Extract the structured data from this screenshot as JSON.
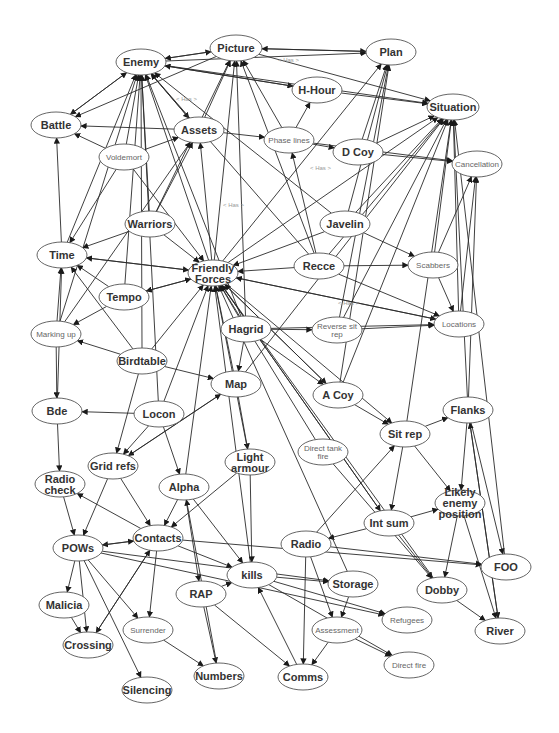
{
  "diagram": {
    "type": "concept-network",
    "nodes": [
      {
        "id": "enemy",
        "label": "Enemy",
        "x": 141,
        "y": 62,
        "rx": 25,
        "ry": 13,
        "style": "bold"
      },
      {
        "id": "picture",
        "label": "Picture",
        "x": 236,
        "y": 48,
        "rx": 26,
        "ry": 13,
        "style": "bold"
      },
      {
        "id": "plan",
        "label": "Plan",
        "x": 391,
        "y": 52,
        "rx": 25,
        "ry": 13,
        "style": "bold"
      },
      {
        "id": "hhour",
        "label": "H-Hour",
        "x": 317,
        "y": 90,
        "rx": 25,
        "ry": 13,
        "style": "bold"
      },
      {
        "id": "situation",
        "label": "Situation",
        "x": 453,
        "y": 107,
        "rx": 26,
        "ry": 13,
        "style": "bold"
      },
      {
        "id": "battle",
        "label": "Battle",
        "x": 56,
        "y": 125,
        "rx": 25,
        "ry": 13,
        "style": "bold"
      },
      {
        "id": "assets",
        "label": "Assets",
        "x": 199,
        "y": 130,
        "rx": 25,
        "ry": 13,
        "style": "bold"
      },
      {
        "id": "phaselines",
        "label": "Phase lines",
        "x": 289,
        "y": 140,
        "rx": 25,
        "ry": 13,
        "style": "light"
      },
      {
        "id": "dcoy",
        "label": "D Coy",
        "x": 358,
        "y": 152,
        "rx": 25,
        "ry": 13,
        "style": "bold"
      },
      {
        "id": "voldemort",
        "label": "Voldemort",
        "x": 124,
        "y": 157,
        "rx": 25,
        "ry": 13,
        "style": "light"
      },
      {
        "id": "cancellation",
        "label": "Cancellation",
        "x": 477,
        "y": 164,
        "rx": 25,
        "ry": 13,
        "style": "light"
      },
      {
        "id": "warriors",
        "label": "Warriors",
        "x": 150,
        "y": 224,
        "rx": 25,
        "ry": 13,
        "style": "bold"
      },
      {
        "id": "javelin",
        "label": "Javelin",
        "x": 345,
        "y": 224,
        "rx": 25,
        "ry": 13,
        "style": "bold"
      },
      {
        "id": "time",
        "label": "Time",
        "x": 62,
        "y": 255,
        "rx": 25,
        "ry": 13,
        "style": "bold"
      },
      {
        "id": "friendly",
        "label": "Friendly Forces",
        "x": 213,
        "y": 273,
        "rx": 25,
        "ry": 13,
        "style": "bold"
      },
      {
        "id": "recce",
        "label": "Recce",
        "x": 319,
        "y": 266,
        "rx": 25,
        "ry": 13,
        "style": "bold"
      },
      {
        "id": "scabbers",
        "label": "Scabbers",
        "x": 433,
        "y": 265,
        "rx": 25,
        "ry": 13,
        "style": "light"
      },
      {
        "id": "tempo",
        "label": "Tempo",
        "x": 124,
        "y": 297,
        "rx": 25,
        "ry": 13,
        "style": "bold"
      },
      {
        "id": "markingup",
        "label": "Marking up",
        "x": 56,
        "y": 334,
        "rx": 25,
        "ry": 13,
        "style": "light"
      },
      {
        "id": "hagrid",
        "label": "Hagrid",
        "x": 246,
        "y": 329,
        "rx": 25,
        "ry": 13,
        "style": "bold"
      },
      {
        "id": "reversesitrep",
        "label": "Reverse sit rep",
        "x": 337,
        "y": 330,
        "rx": 25,
        "ry": 13,
        "style": "light"
      },
      {
        "id": "locations",
        "label": "Locations",
        "x": 459,
        "y": 324,
        "rx": 25,
        "ry": 13,
        "style": "light"
      },
      {
        "id": "birdtable",
        "label": "Birdtable",
        "x": 142,
        "y": 361,
        "rx": 25,
        "ry": 13,
        "style": "bold"
      },
      {
        "id": "map",
        "label": "Map",
        "x": 236,
        "y": 384,
        "rx": 25,
        "ry": 13,
        "style": "bold"
      },
      {
        "id": "acoy",
        "label": "A Coy",
        "x": 338,
        "y": 395,
        "rx": 25,
        "ry": 13,
        "style": "bold"
      },
      {
        "id": "flanks",
        "label": "Flanks",
        "x": 468,
        "y": 410,
        "rx": 25,
        "ry": 13,
        "style": "bold"
      },
      {
        "id": "bde",
        "label": "Bde",
        "x": 57,
        "y": 411,
        "rx": 25,
        "ry": 13,
        "style": "bold"
      },
      {
        "id": "locon",
        "label": "Locon",
        "x": 159,
        "y": 414,
        "rx": 25,
        "ry": 13,
        "style": "bold"
      },
      {
        "id": "sitrep",
        "label": "Sit rep",
        "x": 405,
        "y": 434,
        "rx": 25,
        "ry": 13,
        "style": "bold"
      },
      {
        "id": "directtankfire",
        "label": "Direct tank fire",
        "x": 323,
        "y": 452,
        "rx": 25,
        "ry": 13,
        "style": "light"
      },
      {
        "id": "lightarmour",
        "label": "Light armour",
        "x": 250,
        "y": 462,
        "rx": 25,
        "ry": 13,
        "style": "bold"
      },
      {
        "id": "gridrefs",
        "label": "Grid refs",
        "x": 113,
        "y": 466,
        "rx": 25,
        "ry": 13,
        "style": "bold"
      },
      {
        "id": "radiocheck",
        "label": "Radio check",
        "x": 60,
        "y": 484,
        "rx": 25,
        "ry": 13,
        "style": "bold"
      },
      {
        "id": "alpha",
        "label": "Alpha",
        "x": 184,
        "y": 487,
        "rx": 25,
        "ry": 13,
        "style": "bold"
      },
      {
        "id": "likelyenemy",
        "label": "Likely enemy position",
        "x": 460,
        "y": 503,
        "rx": 25,
        "ry": 13,
        "style": "bold"
      },
      {
        "id": "intsum",
        "label": "Int sum",
        "x": 389,
        "y": 523,
        "rx": 25,
        "ry": 13,
        "style": "bold"
      },
      {
        "id": "contacts",
        "label": "Contacts",
        "x": 158,
        "y": 538,
        "rx": 25,
        "ry": 13,
        "style": "bold"
      },
      {
        "id": "radio",
        "label": "Radio",
        "x": 306,
        "y": 544,
        "rx": 25,
        "ry": 13,
        "style": "bold"
      },
      {
        "id": "pows",
        "label": "POWs",
        "x": 78,
        "y": 548,
        "rx": 25,
        "ry": 13,
        "style": "bold"
      },
      {
        "id": "foo",
        "label": "FOO",
        "x": 506,
        "y": 567,
        "rx": 25,
        "ry": 13,
        "style": "bold"
      },
      {
        "id": "kills",
        "label": "kills",
        "x": 252,
        "y": 575,
        "rx": 25,
        "ry": 13,
        "style": "bold"
      },
      {
        "id": "dobby",
        "label": "Dobby",
        "x": 442,
        "y": 590,
        "rx": 25,
        "ry": 13,
        "style": "bold"
      },
      {
        "id": "storage",
        "label": "Storage",
        "x": 353,
        "y": 584,
        "rx": 25,
        "ry": 13,
        "style": "bold"
      },
      {
        "id": "rap",
        "label": "RAP",
        "x": 201,
        "y": 594,
        "rx": 25,
        "ry": 13,
        "style": "bold"
      },
      {
        "id": "malicia",
        "label": "Malicia",
        "x": 64,
        "y": 605,
        "rx": 25,
        "ry": 13,
        "style": "bold"
      },
      {
        "id": "refugees",
        "label": "Refugees",
        "x": 407,
        "y": 620,
        "rx": 25,
        "ry": 13,
        "style": "light"
      },
      {
        "id": "river",
        "label": "River",
        "x": 500,
        "y": 631,
        "rx": 25,
        "ry": 13,
        "style": "bold"
      },
      {
        "id": "assessment",
        "label": "Assessment",
        "x": 337,
        "y": 630,
        "rx": 25,
        "ry": 13,
        "style": "light"
      },
      {
        "id": "surrender",
        "label": "Surrender",
        "x": 148,
        "y": 630,
        "rx": 25,
        "ry": 13,
        "style": "light"
      },
      {
        "id": "crossing",
        "label": "Crossing",
        "x": 88,
        "y": 645,
        "rx": 25,
        "ry": 13,
        "style": "bold"
      },
      {
        "id": "directfire",
        "label": "Direct fire",
        "x": 409,
        "y": 665,
        "rx": 25,
        "ry": 13,
        "style": "light"
      },
      {
        "id": "numbers",
        "label": "Numbers",
        "x": 219,
        "y": 676,
        "rx": 25,
        "ry": 13,
        "style": "bold"
      },
      {
        "id": "comms",
        "label": "Comms",
        "x": 303,
        "y": 677,
        "rx": 25,
        "ry": 13,
        "style": "bold"
      },
      {
        "id": "silencing",
        "label": "Silencing",
        "x": 147,
        "y": 690,
        "rx": 25,
        "ry": 13,
        "style": "bold"
      }
    ],
    "edge_labels": [
      {
        "text": "< Has >",
        "x": 176,
        "y": 101
      },
      {
        "text": "< Has >",
        "x": 278,
        "y": 62
      },
      {
        "text": "< Has >",
        "x": 310,
        "y": 170
      },
      {
        "text": "< Has >",
        "x": 223,
        "y": 207
      },
      {
        "text": "< Has >",
        "x": 338,
        "y": 305
      }
    ],
    "edges": [
      [
        "enemy",
        "picture"
      ],
      [
        "picture",
        "enemy"
      ],
      [
        "enemy",
        "battle"
      ],
      [
        "battle",
        "enemy"
      ],
      [
        "enemy",
        "assets"
      ],
      [
        "enemy",
        "plan"
      ],
      [
        "enemy",
        "hhour"
      ],
      [
        "enemy",
        "situation"
      ],
      [
        "picture",
        "plan"
      ],
      [
        "picture",
        "situation"
      ],
      [
        "picture",
        "battle"
      ],
      [
        "plan",
        "picture"
      ],
      [
        "hhour",
        "situation"
      ],
      [
        "hhour",
        "enemy"
      ],
      [
        "assets",
        "battle"
      ],
      [
        "assets",
        "phaselines"
      ],
      [
        "assets",
        "picture"
      ],
      [
        "assets",
        "enemy"
      ],
      [
        "phaselines",
        "dcoy"
      ],
      [
        "phaselines",
        "cancellation"
      ],
      [
        "phaselines",
        "hhour"
      ],
      [
        "phaselines",
        "picture"
      ],
      [
        "dcoy",
        "situation"
      ],
      [
        "dcoy",
        "cancellation"
      ],
      [
        "dcoy",
        "plan"
      ],
      [
        "voldemort",
        "battle"
      ],
      [
        "voldemort",
        "assets"
      ],
      [
        "voldemort",
        "enemy"
      ],
      [
        "voldemort",
        "time"
      ],
      [
        "voldemort",
        "friendly"
      ],
      [
        "warriors",
        "enemy"
      ],
      [
        "warriors",
        "time"
      ],
      [
        "warriors",
        "friendly"
      ],
      [
        "warriors",
        "picture"
      ],
      [
        "warriors",
        "assets"
      ],
      [
        "javelin",
        "enemy"
      ],
      [
        "javelin",
        "situation"
      ],
      [
        "javelin",
        "plan"
      ],
      [
        "javelin",
        "scabbers"
      ],
      [
        "javelin",
        "friendly"
      ],
      [
        "time",
        "battle"
      ],
      [
        "time",
        "friendly"
      ],
      [
        "time",
        "enemy"
      ],
      [
        "friendly",
        "time"
      ],
      [
        "friendly",
        "tempo"
      ],
      [
        "friendly",
        "enemy"
      ],
      [
        "friendly",
        "picture"
      ],
      [
        "friendly",
        "plan"
      ],
      [
        "friendly",
        "situation"
      ],
      [
        "friendly",
        "assets"
      ],
      [
        "friendly",
        "acoy"
      ],
      [
        "friendly",
        "sitrep"
      ],
      [
        "friendly",
        "intsum"
      ],
      [
        "friendly",
        "locations"
      ],
      [
        "recce",
        "friendly"
      ],
      [
        "recce",
        "situation"
      ],
      [
        "recce",
        "picture"
      ],
      [
        "recce",
        "locations"
      ],
      [
        "recce",
        "phaselines"
      ],
      [
        "recce",
        "enemy"
      ],
      [
        "recce",
        "scabbers"
      ],
      [
        "scabbers",
        "situation"
      ],
      [
        "scabbers",
        "cancellation"
      ],
      [
        "scabbers",
        "locations"
      ],
      [
        "tempo",
        "time"
      ],
      [
        "tempo",
        "friendly"
      ],
      [
        "tempo",
        "enemy"
      ],
      [
        "tempo",
        "markingup"
      ],
      [
        "markingup",
        "time"
      ],
      [
        "markingup",
        "enemy"
      ],
      [
        "markingup",
        "assets"
      ],
      [
        "markingup",
        "bde"
      ],
      [
        "hagrid",
        "friendly"
      ],
      [
        "hagrid",
        "map"
      ],
      [
        "hagrid",
        "reversesitrep"
      ],
      [
        "hagrid",
        "locations"
      ],
      [
        "hagrid",
        "picture"
      ],
      [
        "hagrid",
        "enemy"
      ],
      [
        "hagrid",
        "acoy"
      ],
      [
        "reversesitrep",
        "situation"
      ],
      [
        "reversesitrep",
        "plan"
      ],
      [
        "reversesitrep",
        "locations"
      ],
      [
        "locations",
        "situation"
      ],
      [
        "locations",
        "friendly"
      ],
      [
        "locations",
        "cancellation"
      ],
      [
        "birdtable",
        "markingup"
      ],
      [
        "birdtable",
        "friendly"
      ],
      [
        "birdtable",
        "map"
      ],
      [
        "birdtable",
        "time"
      ],
      [
        "birdtable",
        "enemy"
      ],
      [
        "birdtable",
        "gridrefs"
      ],
      [
        "map",
        "friendly"
      ],
      [
        "map",
        "lightarmour"
      ],
      [
        "map",
        "gridrefs"
      ],
      [
        "map",
        "situation"
      ],
      [
        "acoy",
        "friendly"
      ],
      [
        "acoy",
        "sitrep"
      ],
      [
        "acoy",
        "situation"
      ],
      [
        "acoy",
        "plan"
      ],
      [
        "flanks",
        "situation"
      ],
      [
        "flanks",
        "cancellation"
      ],
      [
        "flanks",
        "likelyenemy"
      ],
      [
        "flanks",
        "river"
      ],
      [
        "flanks",
        "foo"
      ],
      [
        "bde",
        "time"
      ],
      [
        "bde",
        "radiocheck"
      ],
      [
        "locon",
        "bde"
      ],
      [
        "locon",
        "gridrefs"
      ],
      [
        "locon",
        "alpha"
      ],
      [
        "locon",
        "friendly"
      ],
      [
        "locon",
        "enemy"
      ],
      [
        "sitrep",
        "situation"
      ],
      [
        "sitrep",
        "likelyenemy"
      ],
      [
        "sitrep",
        "intsum"
      ],
      [
        "sitrep",
        "flanks"
      ],
      [
        "directtankfire",
        "friendly"
      ],
      [
        "directtankfire",
        "dobby"
      ],
      [
        "lightarmour",
        "friendly"
      ],
      [
        "lightarmour",
        "contacts"
      ],
      [
        "lightarmour",
        "kills"
      ],
      [
        "gridrefs",
        "contacts"
      ],
      [
        "gridrefs",
        "pows"
      ],
      [
        "gridrefs",
        "map"
      ],
      [
        "radiocheck",
        "pows"
      ],
      [
        "alpha",
        "contacts"
      ],
      [
        "alpha",
        "kills"
      ],
      [
        "alpha",
        "rap"
      ],
      [
        "alpha",
        "friendly"
      ],
      [
        "likelyenemy",
        "dobby"
      ],
      [
        "likelyenemy",
        "river"
      ],
      [
        "intsum",
        "likelyenemy"
      ],
      [
        "intsum",
        "radio"
      ],
      [
        "intsum",
        "dobby"
      ],
      [
        "intsum",
        "friendly"
      ],
      [
        "contacts",
        "radiocheck"
      ],
      [
        "contacts",
        "pows"
      ],
      [
        "contacts",
        "kills"
      ],
      [
        "contacts",
        "foo"
      ],
      [
        "contacts",
        "crossing"
      ],
      [
        "contacts",
        "surrender"
      ],
      [
        "radio",
        "comms"
      ],
      [
        "radio",
        "assessment"
      ],
      [
        "radio",
        "foo"
      ],
      [
        "radio",
        "sitrep"
      ],
      [
        "pows",
        "malicia"
      ],
      [
        "pows",
        "crossing"
      ],
      [
        "pows",
        "surrender"
      ],
      [
        "pows",
        "silencing"
      ],
      [
        "pows",
        "contacts"
      ],
      [
        "pows",
        "storage"
      ],
      [
        "pows",
        "refugees"
      ],
      [
        "kills",
        "storage"
      ],
      [
        "kills",
        "refugees"
      ],
      [
        "kills",
        "directfire"
      ],
      [
        "kills",
        "friendly"
      ],
      [
        "storage",
        "assessment"
      ],
      [
        "storage",
        "friendly"
      ],
      [
        "rap",
        "numbers"
      ],
      [
        "rap",
        "kills"
      ],
      [
        "rap",
        "comms"
      ],
      [
        "assessment",
        "directfire"
      ],
      [
        "assessment",
        "comms"
      ],
      [
        "surrender",
        "numbers"
      ],
      [
        "dobby",
        "river"
      ],
      [
        "malicia",
        "crossing"
      ],
      [
        "river",
        "flanks"
      ],
      [
        "foo",
        "situation"
      ],
      [
        "dobby",
        "friendly"
      ],
      [
        "crossing",
        "contacts"
      ],
      [
        "numbers",
        "alpha"
      ],
      [
        "comms",
        "kills"
      ]
    ]
  }
}
